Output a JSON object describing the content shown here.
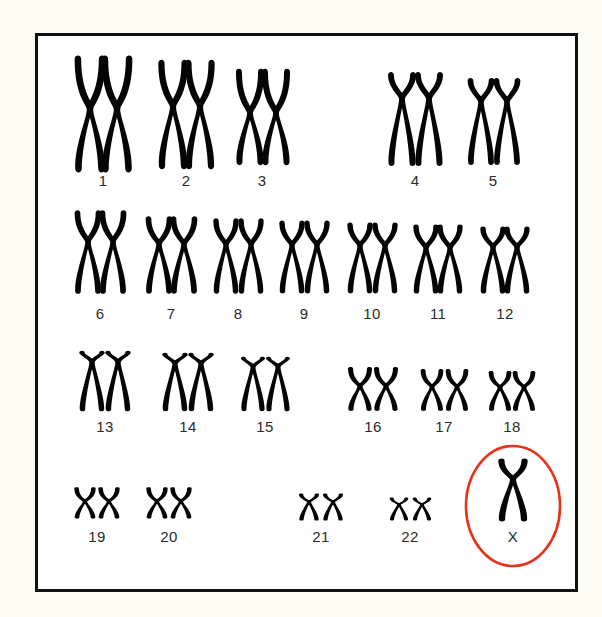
{
  "figure": {
    "frame_color": "#111111",
    "background_color": "#ffffff",
    "page_background_color": "#fdfdf3",
    "chromosome_color": "#050505",
    "label_color": "#2b2b2b",
    "highlight_color": "#e8321a"
  },
  "highlight": {
    "name": "x-chromosome-highlight",
    "shape": "ellipse",
    "cx": 475,
    "cy": 470,
    "rx": 47,
    "ry": 60,
    "stroke": "#e8321a",
    "stroke_width": 2.6,
    "encircles": "X"
  },
  "rows": [
    {
      "name": "row-1",
      "label_y": 150,
      "groups": [
        {
          "label": "1",
          "label_x": 65,
          "count": 2,
          "top": 22,
          "height": 112,
          "width": 23,
          "centromere": 0.45,
          "xs": [
            52,
            79
          ]
        },
        {
          "label": "2",
          "label_x": 148,
          "count": 2,
          "top": 26,
          "height": 105,
          "width": 22,
          "centromere": 0.42,
          "xs": [
            135,
            162
          ]
        },
        {
          "label": "3",
          "label_x": 224,
          "count": 2,
          "top": 35,
          "height": 92,
          "width": 21,
          "centromere": 0.45,
          "xs": [
            212,
            238
          ]
        },
        {
          "label": "4",
          "label_x": 377,
          "count": 2,
          "top": 38,
          "height": 90,
          "width": 21,
          "centromere": 0.27,
          "xs": [
            364,
            391
          ]
        },
        {
          "label": "5",
          "label_x": 455,
          "count": 2,
          "top": 44,
          "height": 83,
          "width": 20,
          "centromere": 0.26,
          "xs": [
            443,
            469
          ]
        }
      ]
    },
    {
      "name": "row-2",
      "label_y": 283,
      "groups": [
        {
          "label": "6",
          "label_x": 62,
          "count": 2,
          "top": 176,
          "height": 80,
          "width": 20,
          "centromere": 0.37,
          "xs": [
            50,
            75
          ]
        },
        {
          "label": "7",
          "label_x": 133,
          "count": 2,
          "top": 182,
          "height": 74,
          "width": 20,
          "centromere": 0.35,
          "xs": [
            121,
            146
          ]
        },
        {
          "label": "8",
          "label_x": 200,
          "count": 2,
          "top": 184,
          "height": 72,
          "width": 19,
          "centromere": 0.34,
          "xs": [
            188,
            213
          ]
        },
        {
          "label": "9",
          "label_x": 266,
          "count": 2,
          "top": 186,
          "height": 70,
          "width": 19,
          "centromere": 0.33,
          "xs": [
            254,
            279
          ]
        },
        {
          "label": "10",
          "label_x": 334,
          "count": 2,
          "top": 188,
          "height": 68,
          "width": 19,
          "centromere": 0.32,
          "xs": [
            322,
            347
          ]
        },
        {
          "label": "11",
          "label_x": 400,
          "count": 2,
          "top": 190,
          "height": 66,
          "width": 19,
          "centromere": 0.33,
          "xs": [
            388,
            412
          ]
        },
        {
          "label": "12",
          "label_x": 467,
          "count": 2,
          "top": 192,
          "height": 64,
          "width": 19,
          "centromere": 0.3,
          "xs": [
            455,
            479
          ]
        }
      ]
    },
    {
      "name": "row-3",
      "label_y": 396,
      "groups": [
        {
          "label": "13",
          "label_x": 67,
          "count": 2,
          "top": 316,
          "height": 58,
          "width": 19,
          "centromere": 0.17,
          "xs": [
            54,
            80
          ]
        },
        {
          "label": "14",
          "label_x": 150,
          "count": 2,
          "top": 318,
          "height": 56,
          "width": 19,
          "centromere": 0.17,
          "xs": [
            137,
            163
          ]
        },
        {
          "label": "15",
          "label_x": 227,
          "count": 2,
          "top": 322,
          "height": 52,
          "width": 18,
          "centromere": 0.17,
          "xs": [
            215,
            240
          ]
        },
        {
          "label": "16",
          "label_x": 335,
          "count": 2,
          "top": 332,
          "height": 42,
          "width": 18,
          "centromere": 0.43,
          "xs": [
            322,
            348
          ]
        },
        {
          "label": "17",
          "label_x": 406,
          "count": 2,
          "top": 334,
          "height": 40,
          "width": 17,
          "centromere": 0.42,
          "xs": [
            394,
            419
          ]
        },
        {
          "label": "18",
          "label_x": 474,
          "count": 2,
          "top": 336,
          "height": 38,
          "width": 17,
          "centromere": 0.4,
          "xs": [
            462,
            486
          ]
        }
      ]
    },
    {
      "name": "row-4",
      "label_y": 506,
      "groups": [
        {
          "label": "19",
          "label_x": 59,
          "count": 2,
          "top": 452,
          "height": 30,
          "width": 16,
          "centromere": 0.45,
          "xs": [
            47,
            71
          ]
        },
        {
          "label": "20",
          "label_x": 131,
          "count": 2,
          "top": 452,
          "height": 30,
          "width": 16,
          "centromere": 0.45,
          "xs": [
            119,
            143
          ]
        },
        {
          "label": "21",
          "label_x": 283,
          "count": 2,
          "top": 458,
          "height": 26,
          "width": 15,
          "centromere": 0.3,
          "xs": [
            271,
            295
          ]
        },
        {
          "label": "22",
          "label_x": 372,
          "count": 2,
          "top": 462,
          "height": 22,
          "width": 14,
          "centromere": 0.3,
          "xs": [
            361,
            384
          ]
        },
        {
          "label": "X",
          "label_x": 475,
          "count": 1,
          "top": 424,
          "height": 60,
          "width": 22,
          "centromere": 0.32,
          "xs": [
            475
          ]
        }
      ]
    }
  ],
  "labels_flat": [
    "1",
    "2",
    "3",
    "4",
    "5",
    "6",
    "7",
    "8",
    "9",
    "10",
    "11",
    "12",
    "13",
    "14",
    "15",
    "16",
    "17",
    "18",
    "19",
    "20",
    "21",
    "22",
    "X"
  ],
  "summary": {
    "total_numbered_pairs": 22,
    "sex_chromosomes_shown": 1,
    "sex_chromosome_label": "X"
  }
}
